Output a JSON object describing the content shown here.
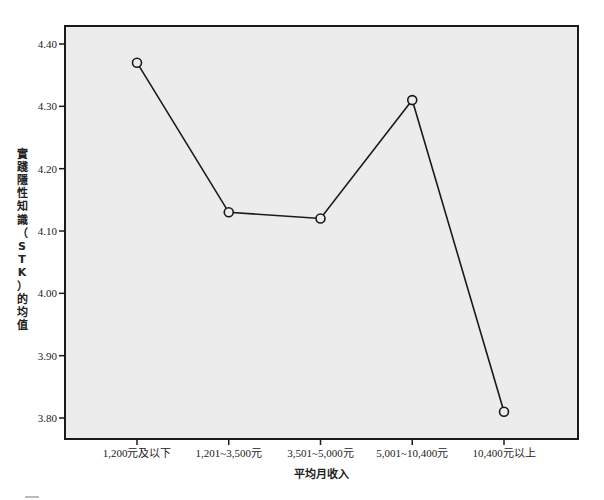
{
  "chart_data": {
    "type": "line",
    "title": "",
    "xlabel": "平均月收入",
    "ylabel": "實踐隱性知識（STK）的均值",
    "categories": [
      "1,200元及以下",
      "1,201~3,500元",
      "3,501~5,000元",
      "5,001~10,400元",
      "10,400元以上"
    ],
    "series": [
      {
        "name": "STK均值",
        "values": [
          4.37,
          4.13,
          4.12,
          4.31,
          3.81
        ],
        "marker": "circle"
      }
    ],
    "ylim": [
      3.8,
      4.4
    ],
    "yticks": [
      "3.80",
      "3.90",
      "4.00",
      "4.10",
      "4.20",
      "4.30",
      "4.40"
    ],
    "grid": false,
    "legend": "none",
    "colors": {
      "line": "#1a1a1a",
      "plot_background": "#ececec",
      "frame": "#1a1a1a"
    }
  }
}
